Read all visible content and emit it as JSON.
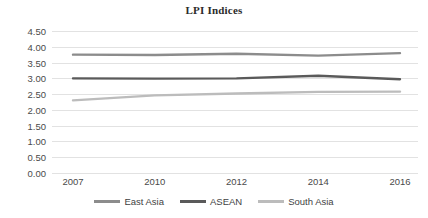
{
  "chart_data": {
    "type": "line",
    "title": "LPI Indices",
    "xlabel": "",
    "ylabel": "",
    "categories": [
      "2007",
      "2010",
      "2012",
      "2014",
      "2016"
    ],
    "x": [
      2007,
      2010,
      2012,
      2014,
      2016
    ],
    "ylim": [
      0.0,
      4.5
    ],
    "yticks": [
      "0.00",
      "0.50",
      "1.00",
      "1.50",
      "2.00",
      "2.50",
      "3.00",
      "3.50",
      "4.00",
      "4.50"
    ],
    "ytick_values": [
      0.0,
      0.5,
      1.0,
      1.5,
      2.0,
      2.5,
      3.0,
      3.5,
      4.0,
      4.5
    ],
    "grid": true,
    "legend_position": "bottom",
    "series": [
      {
        "name": "East Asia",
        "values": [
          3.75,
          3.74,
          3.78,
          3.72,
          3.8
        ],
        "color": "#8c8c8c"
      },
      {
        "name": "ASEAN",
        "values": [
          3.0,
          2.99,
          3.0,
          3.08,
          2.97
        ],
        "color": "#5a5a5a"
      },
      {
        "name": "South Asia",
        "values": [
          2.3,
          2.46,
          2.52,
          2.57,
          2.58
        ],
        "color": "#bcbcbc"
      }
    ]
  },
  "legend": {
    "items": [
      {
        "label": "East Asia",
        "color": "#8c8c8c"
      },
      {
        "label": "ASEAN",
        "color": "#5a5a5a"
      },
      {
        "label": "South Asia",
        "color": "#bcbcbc"
      }
    ]
  },
  "colors": {
    "grid": "#e2e2e2",
    "text": "#4a4a4a",
    "title": "#2b2b2b",
    "background": "#ffffff"
  }
}
